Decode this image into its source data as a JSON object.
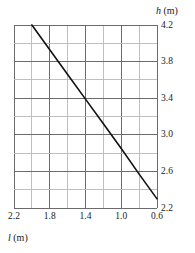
{
  "chart_data": {
    "type": "line",
    "title": "",
    "subtitle": "",
    "xlabel_var": "l",
    "xlabel_unit": "(m)",
    "ylabel_var": "h",
    "ylabel_unit": "(m)",
    "xlabel": "l (m)",
    "ylabel": "h (m)",
    "xlim": [
      2.2,
      0.6
    ],
    "ylim": [
      2.2,
      4.2
    ],
    "x_reversed": true,
    "x_tick_labels": [
      "2.2",
      "1.8",
      "1.4",
      "1.0",
      "0.6"
    ],
    "x_tick_values": [
      2.2,
      1.8,
      1.4,
      1.0,
      0.6
    ],
    "y_tick_labels": [
      "4.2",
      "3.8",
      "3.4",
      "3.0",
      "2.6",
      "2.2"
    ],
    "y_tick_values": [
      4.2,
      3.8,
      3.4,
      3.0,
      2.6,
      2.2
    ],
    "x_minor_step": 0.2,
    "y_minor_step": 0.2,
    "grid": true,
    "grid_columns": 8,
    "grid_rows": 10,
    "grid_major_color": "#6b6b6b",
    "grid_minor_color": "#b8b8b8",
    "axis_color": "#6b6b6b",
    "legend": null,
    "legend_position": "none",
    "series": [
      {
        "name": "h vs l",
        "color": "#111111",
        "line_width": 1.6,
        "x": [
          2.0,
          1.8,
          1.6,
          1.4,
          1.2,
          1.0,
          0.8,
          0.6
        ],
        "y": [
          4.2,
          3.93,
          3.66,
          3.39,
          3.12,
          2.85,
          2.57,
          2.3
        ],
        "points": [
          {
            "x": 2.0,
            "y": 4.2
          },
          {
            "x": 1.4,
            "y": 3.39
          },
          {
            "x": 0.6,
            "y": 2.3
          }
        ]
      }
    ]
  }
}
